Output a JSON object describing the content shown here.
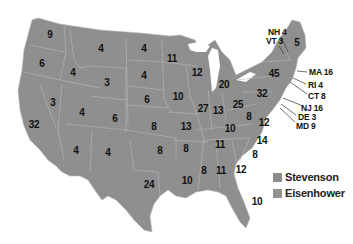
{
  "map": {
    "subject": "US presidential election electoral votes by state",
    "fill_color": "#8f8f8f",
    "border_color": "#b8b8b8"
  },
  "legend": {
    "items": [
      {
        "label": "Stevenson",
        "color": "#8c8c8c"
      },
      {
        "label": "Eisenhower",
        "color": "#939393"
      }
    ]
  },
  "states": {
    "WA": "9",
    "OR": "6",
    "CA": "32",
    "ID": "4",
    "NV": "3",
    "MT": "4",
    "WY": "3",
    "UT": "4",
    "AZ": "4",
    "CO": "6",
    "NM": "4",
    "ND": "4",
    "SD": "4",
    "NE": "6",
    "KS": "8",
    "OK": "8",
    "TX": "24",
    "MN": "11",
    "IA": "10",
    "MO": "13",
    "AR": "8",
    "LA": "10",
    "WI": "12",
    "IL": "27",
    "MI": "20",
    "IN": "13",
    "OH": "25",
    "KY": "10",
    "TN": "11",
    "MS": "8",
    "AL": "11",
    "GA": "12",
    "FL": "10",
    "SC": "8",
    "NC": "14",
    "VA": "12",
    "WV": "8",
    "PA": "32",
    "NY": "45",
    "ME": "5"
  },
  "callouts": {
    "NH": "NH 4",
    "VT": "VT 3",
    "MA": "MA 16",
    "RI": "RI 4",
    "CT": "CT 8",
    "NJ": "NJ 16",
    "DE": "DE 3",
    "MD": "MD 9"
  }
}
